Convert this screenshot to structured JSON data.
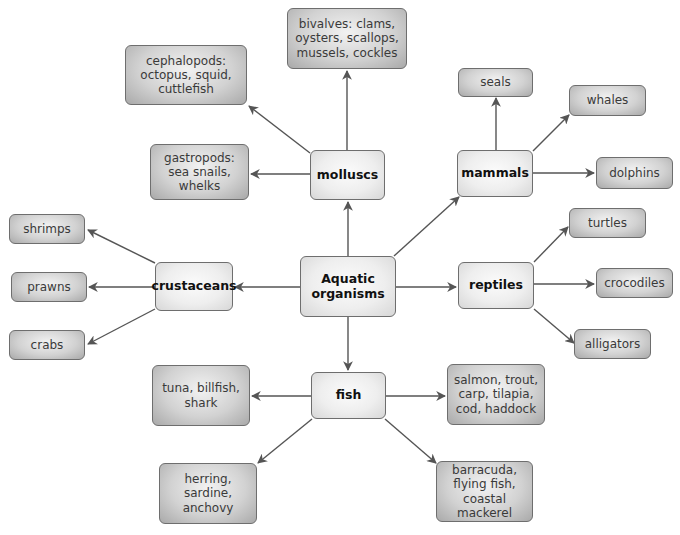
{
  "title": "Aquatic organisms",
  "root": {
    "label": "Aquatic\norganisms"
  },
  "categories": {
    "molluscs": {
      "label": "molluscs"
    },
    "mammals": {
      "label": "mammals"
    },
    "crustaceans": {
      "label": "crustaceans"
    },
    "reptiles": {
      "label": "reptiles"
    },
    "fish": {
      "label": "fish"
    }
  },
  "leaves": {
    "cephalopods": {
      "label": "cephalopods:\noctopus, squid,\ncuttlefish",
      "parent": "molluscs"
    },
    "bivalves": {
      "label": "bivalves: clams,\noysters, scallops,\nmussels, cockles",
      "parent": "molluscs"
    },
    "gastropods": {
      "label": "gastropods:\nsea snails,\nwhelks",
      "parent": "molluscs"
    },
    "seals": {
      "label": "seals",
      "parent": "mammals"
    },
    "whales": {
      "label": "whales",
      "parent": "mammals"
    },
    "dolphins": {
      "label": "dolphins",
      "parent": "mammals"
    },
    "shrimps": {
      "label": "shrimps",
      "parent": "crustaceans"
    },
    "prawns": {
      "label": "prawns",
      "parent": "crustaceans"
    },
    "crabs": {
      "label": "crabs",
      "parent": "crustaceans"
    },
    "turtles": {
      "label": "turtles",
      "parent": "reptiles"
    },
    "crocodiles": {
      "label": "crocodiles",
      "parent": "reptiles"
    },
    "alligators": {
      "label": "alligators",
      "parent": "reptiles"
    },
    "tuna": {
      "label": "tuna, billfish,\nshark",
      "parent": "fish"
    },
    "salmon": {
      "label": "salmon, trout,\ncarp, tilapia,\ncod, haddock",
      "parent": "fish"
    },
    "herring": {
      "label": "herring, sardine,\nanchovy",
      "parent": "fish"
    },
    "barracuda": {
      "label": "barracuda,\nflying fish,\ncoastal mackerel",
      "parent": "fish"
    }
  },
  "colors": {
    "arrow": "#555555",
    "border": "#6e6e6e",
    "leaf_fill_center": "#f2f2f2",
    "leaf_fill_edge": "#a9a9a9",
    "category_fill": "#eeeeee",
    "text": "#3a3a3a"
  }
}
